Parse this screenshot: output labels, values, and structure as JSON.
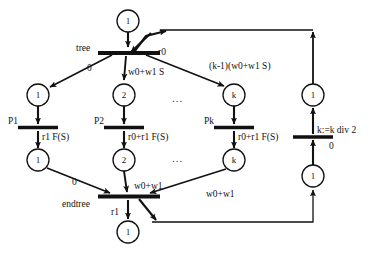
{
  "diagram": {
    "type": "petri-net",
    "title": "",
    "places": [
      {
        "id": "p-top",
        "token": "1",
        "cx": 128,
        "cy": 21,
        "r": 11
      },
      {
        "id": "p-branch-1",
        "token": "1",
        "cx": 38,
        "cy": 95,
        "r": 11
      },
      {
        "id": "p-branch-2",
        "token": "2",
        "cx": 124,
        "cy": 95,
        "r": 11
      },
      {
        "id": "p-branch-k",
        "token": "k",
        "cx": 234,
        "cy": 95,
        "r": 11
      },
      {
        "id": "p-right-top",
        "token": "1",
        "cx": 313,
        "cy": 95,
        "r": 11
      },
      {
        "id": "p-done-1",
        "token": "1",
        "cx": 38,
        "cy": 160,
        "r": 11
      },
      {
        "id": "p-done-2",
        "token": "2",
        "cx": 124,
        "cy": 160,
        "r": 11
      },
      {
        "id": "p-done-k",
        "token": "k",
        "cx": 234,
        "cy": 160,
        "r": 11
      },
      {
        "id": "p-right-bot",
        "token": "1",
        "cx": 313,
        "cy": 176,
        "r": 11
      },
      {
        "id": "p-bottom",
        "token": "1",
        "cx": 128,
        "cy": 232,
        "r": 11
      }
    ],
    "transitions": [
      {
        "id": "t-tree",
        "label": "tree",
        "x": 98,
        "y": 51,
        "w": 62,
        "h": 4
      },
      {
        "id": "t-p1",
        "label": "P1",
        "x": 18,
        "y": 127,
        "w": 40,
        "h": 4
      },
      {
        "id": "t-p2",
        "label": "P2",
        "x": 104,
        "y": 127,
        "w": 40,
        "h": 4
      },
      {
        "id": "t-pk",
        "label": "Pk",
        "x": 214,
        "y": 127,
        "w": 40,
        "h": 4
      },
      {
        "id": "t-right",
        "label": "",
        "x": 293,
        "y": 136,
        "w": 40,
        "h": 4
      },
      {
        "id": "t-endtree",
        "label": "endtree",
        "x": 98,
        "y": 196,
        "w": 62,
        "h": 4
      }
    ],
    "arc_labels": [
      {
        "id": "lbl-tree",
        "text": "tree",
        "x": 76,
        "y": 44
      },
      {
        "id": "lbl-r0",
        "text": "r0",
        "x": 158,
        "y": 48
      },
      {
        "id": "lbl-zero-left",
        "text": "0",
        "x": 87,
        "y": 64
      },
      {
        "id": "lbl-w0w1s",
        "text": "w0+w1 S",
        "x": 128,
        "y": 68
      },
      {
        "id": "lbl-km1",
        "text": "(k-1)(w0+w1 S)",
        "x": 209,
        "y": 62
      },
      {
        "id": "lbl-p1",
        "text": "P1",
        "x": 8,
        "y": 117
      },
      {
        "id": "lbl-p2",
        "text": "P2",
        "x": 94,
        "y": 117
      },
      {
        "id": "lbl-pk",
        "text": "Pk",
        "x": 204,
        "y": 117
      },
      {
        "id": "lbl-r1fs",
        "text": "r1 F(S)",
        "x": 42,
        "y": 133
      },
      {
        "id": "lbl-r0r1fs-2",
        "text": "r0+r1 F(S)",
        "x": 128,
        "y": 133
      },
      {
        "id": "lbl-r0r1fs-k",
        "text": "r0+r1 F(S)",
        "x": 238,
        "y": 133
      },
      {
        "id": "lbl-kdiv2",
        "text": "k:=k div 2",
        "x": 317,
        "y": 126
      },
      {
        "id": "lbl-zero-right",
        "text": "0",
        "x": 329,
        "y": 142
      },
      {
        "id": "lbl-zero-bot",
        "text": "0",
        "x": 72,
        "y": 178
      },
      {
        "id": "lbl-w0w1-mid",
        "text": "w0+w1",
        "x": 134,
        "y": 182
      },
      {
        "id": "lbl-w0w1-k",
        "text": "w0+w1",
        "x": 206,
        "y": 190
      },
      {
        "id": "lbl-endtree",
        "text": "endtree",
        "x": 62,
        "y": 200
      },
      {
        "id": "lbl-r1",
        "text": "r1",
        "x": 111,
        "y": 208
      }
    ],
    "ellipses": [
      {
        "id": "dots-upper",
        "text": "...",
        "x": 172,
        "y": 93
      },
      {
        "id": "dots-lower",
        "text": "...",
        "x": 172,
        "y": 153
      }
    ],
    "colors": {
      "stroke": "#111111",
      "background": "#ffffff",
      "text": "#111111"
    }
  }
}
